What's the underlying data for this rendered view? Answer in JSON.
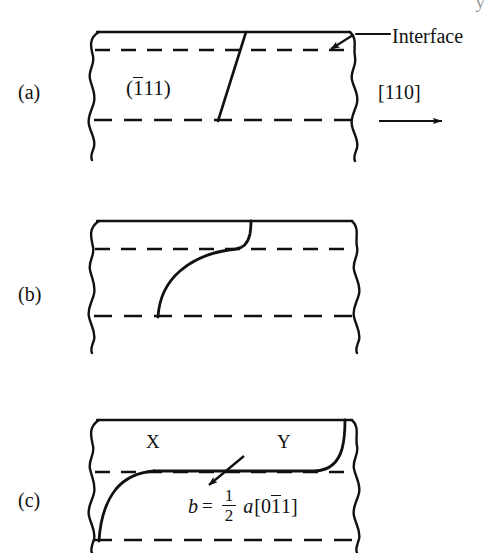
{
  "figure": {
    "type": "schematic-diagram",
    "background_color": "#ffffff",
    "line_color": "#111111",
    "width": 497,
    "height": 553
  },
  "panels": [
    {
      "id": "a",
      "label": "(a)",
      "label_x": 18,
      "label_y": 82,
      "slab": {
        "x": 92,
        "y": 32,
        "width": 262,
        "height": 126
      },
      "interface_dashed_y": 50,
      "lower_dashed_y": 120,
      "dislocation": {
        "kind": "straight-segment",
        "description": "straight dislocation line inclined from upper right to lower left",
        "top_x": 246,
        "bottom_x": 218
      },
      "annotations": [
        {
          "name": "interface",
          "text": "Interface",
          "x": 392,
          "y": 26,
          "leader_from": [
            388,
            35
          ],
          "leader_to": [
            355,
            35
          ],
          "arrow_from": [
            352,
            36
          ],
          "arrow_to": [
            330,
            50
          ]
        },
        {
          "name": "plane-index",
          "text_before": "(",
          "text_overline": "1",
          "text_after": "11)",
          "x": 126,
          "y": 78
        },
        {
          "name": "direction",
          "text": "[110]",
          "x": 378,
          "y": 82,
          "arrow_from": [
            378,
            121
          ],
          "arrow_to": [
            443,
            121
          ]
        }
      ]
    },
    {
      "id": "b",
      "label": "(b)",
      "label_x": 18,
      "label_y": 284,
      "slab": {
        "x": 92,
        "y": 221,
        "width": 262,
        "height": 126
      },
      "interface_dashed_y": 249,
      "lower_dashed_y": 316,
      "dislocation": {
        "kind": "s-curve",
        "description": "dislocation bowed into an S shape, upper end turned up to the interface",
        "bottom_x": 158,
        "mid_cross_x": 238,
        "top_x": 251
      }
    },
    {
      "id": "c",
      "label": "(c)",
      "label_x": 18,
      "label_y": 490,
      "slab": {
        "x": 92,
        "y": 420,
        "width": 262,
        "height": 133
      },
      "interface_dashed_y": 472,
      "lower_dashed_y": 540,
      "dislocation": {
        "kind": "double-bow",
        "description": "dislocation lying along the interface between X and Y with both ends bowed away",
        "left_foot_x": 100,
        "left_knee_x": 152,
        "right_knee_x": 318,
        "right_top_x": 345
      },
      "annotations": [
        {
          "name": "point-x",
          "text": "X",
          "x": 152,
          "y": 444
        },
        {
          "name": "point-y",
          "text": "Y",
          "x": 283,
          "y": 444
        },
        {
          "name": "burgers-vector-arrow",
          "arrow_from": [
            243,
            457
          ],
          "arrow_to": [
            208,
            486
          ]
        }
      ],
      "equation": {
        "symbol": "b",
        "equals": "=",
        "numerator": "1",
        "denominator": "2",
        "lattice_constant": "a",
        "index_open": "[0",
        "index_overline": "1",
        "index_close": "1]",
        "plain_text": "b = 1/2 a[0-11]"
      }
    }
  ],
  "edge_artifact": {
    "text": "y",
    "description": "partially cropped glyph from the text line above the figure"
  }
}
